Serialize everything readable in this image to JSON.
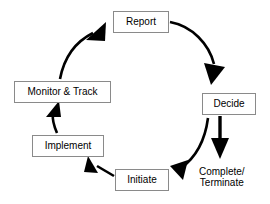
{
  "diagram": {
    "type": "circular-process-flow",
    "direction": "clockwise",
    "colors": {
      "background": "#ffffff",
      "box_fill": "#ffffff",
      "box_border": "#8a8a8a",
      "arrow": "#000000",
      "text": "#000000"
    },
    "nodes": [
      {
        "id": "report",
        "label": "Report",
        "shape": "rectangle",
        "x": 113,
        "y": 11,
        "w": 56,
        "h": 22
      },
      {
        "id": "decide",
        "label": "Decide",
        "shape": "rectangle",
        "x": 202,
        "y": 93,
        "w": 54,
        "h": 22
      },
      {
        "id": "initiate",
        "label": "Initiate",
        "shape": "rectangle",
        "x": 115,
        "y": 169,
        "w": 54,
        "h": 22
      },
      {
        "id": "implement",
        "label": "Implement",
        "shape": "rectangle",
        "x": 32,
        "y": 135,
        "w": 72,
        "h": 22
      },
      {
        "id": "monitor",
        "label": "Monitor & Track",
        "shape": "rectangle",
        "x": 14,
        "y": 81,
        "w": 97,
        "h": 22
      }
    ],
    "free_labels": [
      {
        "id": "complete-terminate",
        "lines": [
          "Complete/",
          "Terminate"
        ],
        "x": 199,
        "y": 166
      }
    ],
    "edges": [
      {
        "id": "report-to-decide",
        "from": "Report",
        "to": "Decide",
        "style": "curved",
        "arrow": "end"
      },
      {
        "id": "decide-to-terminate",
        "from": "Decide",
        "to": "Complete/Terminate",
        "style": "straight",
        "arrow": "end"
      },
      {
        "id": "decide-to-initiate",
        "from": "Decide",
        "to": "Initiate",
        "style": "curved",
        "arrow": "end"
      },
      {
        "id": "initiate-to-implement",
        "from": "Initiate",
        "to": "Implement",
        "style": "straight",
        "arrow": "end"
      },
      {
        "id": "implement-to-monitor",
        "from": "Implement",
        "to": "Monitor & Track",
        "style": "curved",
        "arrow": "end"
      },
      {
        "id": "monitor-to-report",
        "from": "Monitor & Track",
        "to": "Report",
        "style": "curved",
        "arrow": "end"
      }
    ]
  }
}
